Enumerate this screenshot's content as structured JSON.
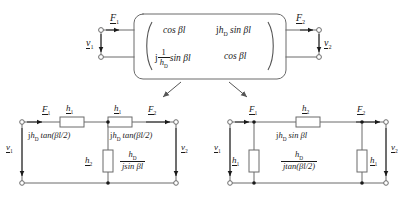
{
  "figure": {
    "type": "two-port-network-equivalents",
    "background": "#ffffff",
    "line_color": "#6b6b6b",
    "text_color": "#1a1a1a"
  },
  "top_block": {
    "name": "transmission-matrix-block",
    "port1": {
      "force_label": "F",
      "force_sub": "1",
      "velocity_label": "v",
      "velocity_sub": "1"
    },
    "port2": {
      "force_label": "F",
      "force_sub": "2",
      "velocity_label": "v",
      "velocity_sub": "2"
    },
    "matrix": {
      "rows": [
        {
          "a": "cos βl",
          "b_j": "j",
          "b_h": "h",
          "b_sub": "D",
          "b_rest": "sin βl"
        },
        {
          "a_j": "j",
          "a_num": "1",
          "a_den_h": "h",
          "a_den_sub": "D",
          "a_rest": "sin βl",
          "b": "cos βl"
        }
      ],
      "m11": "cos βl",
      "m12": "jh_D sin βl",
      "m21": "j (1/h_D) sin βl",
      "m22": "cos βl"
    }
  },
  "t_network": {
    "name": "t-equivalent-network",
    "port1": {
      "force": "F",
      "force_sub": "1",
      "velocity": "v",
      "velocity_sub": "1"
    },
    "port2": {
      "force": "F",
      "force_sub": "2",
      "velocity": "v",
      "velocity_sub": "2"
    },
    "series_left": {
      "symbol": "h",
      "symbol_sub": "1",
      "value_j": "j",
      "value_h": "h",
      "value_sub": "D",
      "value_rest": "tan(βl/2)",
      "value_text": "jh_D tan(βl/2)"
    },
    "series_right": {
      "symbol": "h",
      "symbol_sub": "1",
      "value_j": "j",
      "value_h": "h",
      "value_sub": "D",
      "value_rest": "tan(βl/2)",
      "value_text": "jh_D tan(βl/2)"
    },
    "shunt": {
      "symbol": "h",
      "symbol_sub": "2",
      "num_h": "h",
      "num_sub": "D",
      "den": "jsin βl",
      "value_text": "h_D / (jsin βl)"
    }
  },
  "pi_network": {
    "name": "pi-equivalent-network",
    "port1": {
      "force": "F",
      "force_sub": "1",
      "velocity": "v",
      "velocity_sub": "1"
    },
    "port2": {
      "force": "F",
      "force_sub": "2",
      "velocity": "v",
      "velocity_sub": "2"
    },
    "series": {
      "symbol": "h",
      "symbol_sub": "2",
      "value_j": "j",
      "value_h": "h",
      "value_sub": "D",
      "value_rest": "sin βl",
      "value_text": "jh_D sin βl"
    },
    "shunt_left": {
      "symbol": "h",
      "symbol_sub": "1"
    },
    "shunt_right": {
      "symbol": "h",
      "symbol_sub": "1"
    },
    "shunt_value": {
      "num_h": "h",
      "num_sub": "D",
      "den": "jtan(βl/2)",
      "value_text": "h_D / (jtan(βl/2))"
    }
  }
}
